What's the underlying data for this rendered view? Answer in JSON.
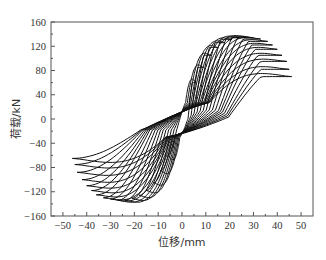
{
  "chart_data": {
    "type": "line",
    "subtype": "hysteresis-loops",
    "title": "",
    "xlabel": "位移/mm",
    "ylabel": "荷载/kN",
    "xlim": [
      -55,
      55
    ],
    "ylim": [
      -160,
      160
    ],
    "xticks": [
      -50,
      -40,
      -30,
      -20,
      -10,
      0,
      10,
      20,
      30,
      40,
      50
    ],
    "yticks": [
      -160,
      -120,
      -80,
      -40,
      0,
      40,
      80,
      120,
      160
    ],
    "grid": false,
    "legend": null,
    "line_color": "#111111",
    "loops": [
      {
        "pos_disp": 6,
        "pos_load": 60,
        "neg_disp": -6,
        "neg_load": -60
      },
      {
        "pos_disp": 9,
        "pos_load": 85,
        "neg_disp": -9,
        "neg_load": -85
      },
      {
        "pos_disp": 12,
        "pos_load": 105,
        "neg_disp": -12,
        "neg_load": -105
      },
      {
        "pos_disp": 15,
        "pos_load": 118,
        "neg_disp": -15,
        "neg_load": -118
      },
      {
        "pos_disp": 18,
        "pos_load": 126,
        "neg_disp": -18,
        "neg_load": -126
      },
      {
        "pos_disp": 21,
        "pos_load": 131,
        "neg_disp": -21,
        "neg_load": -131
      },
      {
        "pos_disp": 24,
        "pos_load": 134,
        "neg_disp": -24,
        "neg_load": -134
      },
      {
        "pos_disp": 27,
        "pos_load": 135,
        "neg_disp": -27,
        "neg_load": -134
      },
      {
        "pos_disp": 30,
        "pos_load": 134,
        "neg_disp": -30,
        "neg_load": -132
      },
      {
        "pos_disp": 33,
        "pos_load": 132,
        "neg_disp": -33,
        "neg_load": -130
      },
      {
        "pos_disp": 36,
        "pos_load": 128,
        "neg_disp": -36,
        "neg_load": -125
      },
      {
        "pos_disp": 38,
        "pos_load": 122,
        "neg_disp": -38,
        "neg_load": -118
      },
      {
        "pos_disp": 40,
        "pos_load": 115,
        "neg_disp": -40,
        "neg_load": -110
      },
      {
        "pos_disp": 42,
        "pos_load": 105,
        "neg_disp": -42,
        "neg_load": -100
      },
      {
        "pos_disp": 44,
        "pos_load": 95,
        "neg_disp": -44,
        "neg_load": -88
      },
      {
        "pos_disp": 45,
        "pos_load": 82,
        "neg_disp": -45,
        "neg_load": -75
      },
      {
        "pos_disp": 46,
        "pos_load": 70,
        "neg_disp": -46,
        "neg_load": -65
      }
    ]
  },
  "layout": {
    "plot_left": 51,
    "plot_right": 313,
    "plot_top": 22,
    "plot_bottom": 216
  }
}
